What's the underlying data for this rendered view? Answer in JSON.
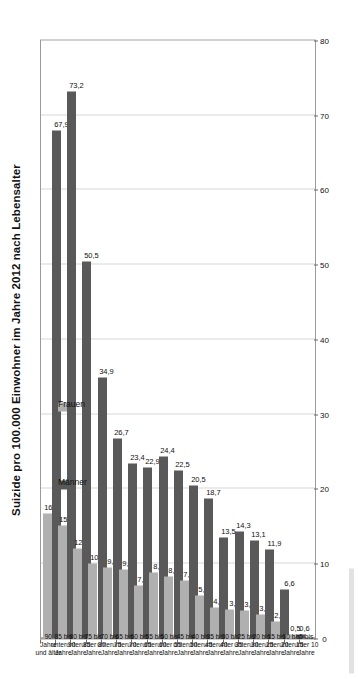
{
  "figure": {
    "title": "Suizide pro 100.000 Einwohner im Jahre 2012 nach Lebensalter",
    "legend": {
      "maenner_label": "Männer",
      "frauen_label": "Frauen",
      "maenner_color": "#595959",
      "frauen_color": "#b0b0b0",
      "position": "inside-top-left"
    }
  },
  "chart_data": {
    "type": "bar",
    "orientation": "horizontal-rotated",
    "title": "Suizide pro 100.000 Einwohner im Jahre 2012 nach Lebensalter",
    "xlabel": "",
    "ylabel": "",
    "ylim": [
      0,
      80
    ],
    "ticks": [
      0,
      10,
      20,
      30,
      40,
      50,
      60,
      70,
      80
    ],
    "grid": true,
    "categories": [
      "5 bis\nunter 10\nJahre",
      "10 bis\nunter 15\nJahre",
      "15 bis\nunter 20\nJahre",
      "20 bis\nunter 25\nJahre",
      "25 bis\nunter 30\nJahre",
      "30 bis\nunter 35\nJahre",
      "35 bis\nunter 40\nJahre",
      "40 bis\nunter 45\nJahre",
      "45 bis\nunter 50\nJahre",
      "50 bis\nunter 55\nJahre",
      "55 bis\nunter 60\nJahre",
      "60 bis\nunter 65\nJahre",
      "65 bis\nunter 70\nJahre",
      "70 bis\nunter 75\nJahre",
      "75 bis\nunter 80\nJahre",
      "80 bis\nunter 85\nJahre",
      "85 bis\nunter 90\nJahre",
      "90\nJahre\nund älter"
    ],
    "series": [
      {
        "name": "Männer",
        "color": "#595959",
        "values": [
          null,
          0.6,
          6.6,
          11.9,
          13.1,
          14.3,
          13.5,
          18.7,
          20.5,
          22.5,
          24.4,
          22.9,
          23.4,
          26.7,
          34.9,
          50.5,
          73.2,
          67.9
        ],
        "labels": [
          "",
          "0,6",
          "6,6",
          "11,9",
          "13,1",
          "14,3",
          "13,5",
          "18,7",
          "20,5",
          "22,5",
          "24,4",
          "22,9",
          "23,4",
          "26,7",
          "34,9",
          "50,5",
          "73,2",
          "67,9"
        ]
      },
      {
        "name": "Frauen",
        "color": "#b0b0b0",
        "values": [
          null,
          0.5,
          2.3,
          3.2,
          3.7,
          3.9,
          4.2,
          5.8,
          7.7,
          8.3,
          8.8,
          7.1,
          9.2,
          9.5,
          10.1,
          12.0,
          15.1,
          16.7
        ],
        "labels": [
          "",
          "0,5",
          "2,3",
          "3,2",
          "3,7",
          "3,9",
          "4,2",
          "5,8",
          "7,7",
          "8,3",
          "8,8",
          "7,1",
          "9,2",
          "9,5",
          "10,1",
          "12,0",
          "15,1",
          "16,7"
        ]
      }
    ]
  }
}
